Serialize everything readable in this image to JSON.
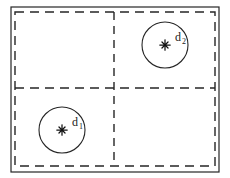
{
  "figure": {
    "background_color": "#ffffff",
    "stroke_color": "#262626",
    "label_color": "#1a1a1a"
  },
  "outer_frame": {
    "name": "outer-solid-rectangle",
    "style": "solid",
    "x": 11,
    "y": 7,
    "width": 208,
    "height": 165,
    "stroke_width": 1.2
  },
  "inner_frame": {
    "name": "inner-dashed-rectangle",
    "style": "dashed",
    "x": 15,
    "y": 12,
    "width": 200,
    "height": 154,
    "stroke_width": 1.4,
    "dash_pattern": "9 6"
  },
  "dividers": [
    {
      "name": "vertical-dashed-divider",
      "orientation": "vertical",
      "x": 114,
      "y1": 12,
      "y2": 166,
      "style": "dashed",
      "dash_pattern": "8 6"
    },
    {
      "name": "horizontal-dashed-divider",
      "orientation": "horizontal",
      "y": 88,
      "x1": 15,
      "x2": 215,
      "style": "dashed",
      "dash_pattern": "9 6"
    }
  ],
  "points": [
    {
      "id": "d1",
      "label": "d",
      "subscript": "1",
      "quadrant": "bottom-left",
      "marker": "asterisk-star-marker",
      "center_x": 62,
      "center_y": 130,
      "circle_radius": 23,
      "label_x": 72,
      "label_y": 126,
      "sub_x": 79,
      "sub_y": 129
    },
    {
      "id": "d2",
      "label": "d",
      "subscript": "2",
      "quadrant": "top-right",
      "marker": "asterisk-star-marker",
      "center_x": 165,
      "center_y": 45,
      "circle_radius": 23,
      "label_x": 175,
      "label_y": 41,
      "sub_x": 182,
      "sub_y": 44
    }
  ]
}
